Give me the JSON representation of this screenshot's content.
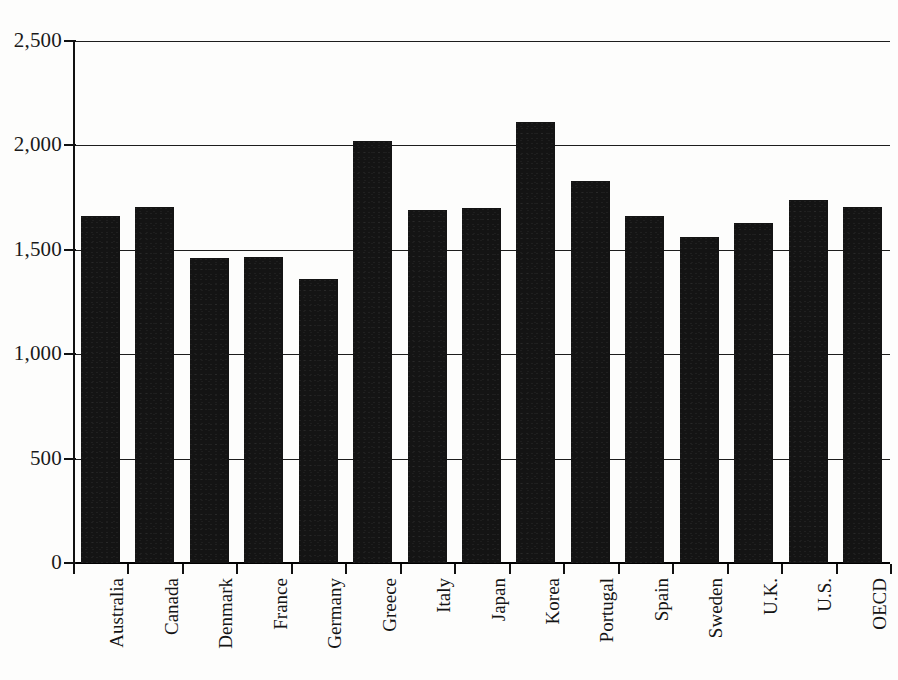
{
  "chart_data": {
    "type": "bar",
    "title": "",
    "subtitle": "",
    "xlabel": "",
    "ylabel": "",
    "ylim": [
      0,
      2500
    ],
    "ytick_values": [
      0,
      500,
      1000,
      1500,
      2000,
      2500
    ],
    "ytick_labels": [
      "0",
      "500",
      "1,000",
      "1,500",
      "2,000",
      "2,500"
    ],
    "grid": true,
    "legend": false,
    "legend_position": "none",
    "bar_color": "#141414",
    "categories": [
      "Australia",
      "Canada",
      "Denmark",
      "France",
      "Germany",
      "Greece",
      "Italy",
      "Japan",
      "Korea",
      "Portugal",
      "Spain",
      "Sweden",
      "U.K.",
      "U.S.",
      "OECD"
    ],
    "values": [
      1660,
      1705,
      1460,
      1465,
      1360,
      2020,
      1690,
      1700,
      2110,
      1830,
      1660,
      1560,
      1630,
      1740,
      1705
    ]
  },
  "axes": {
    "baseline_label": "0",
    "max_label": "2,500"
  }
}
